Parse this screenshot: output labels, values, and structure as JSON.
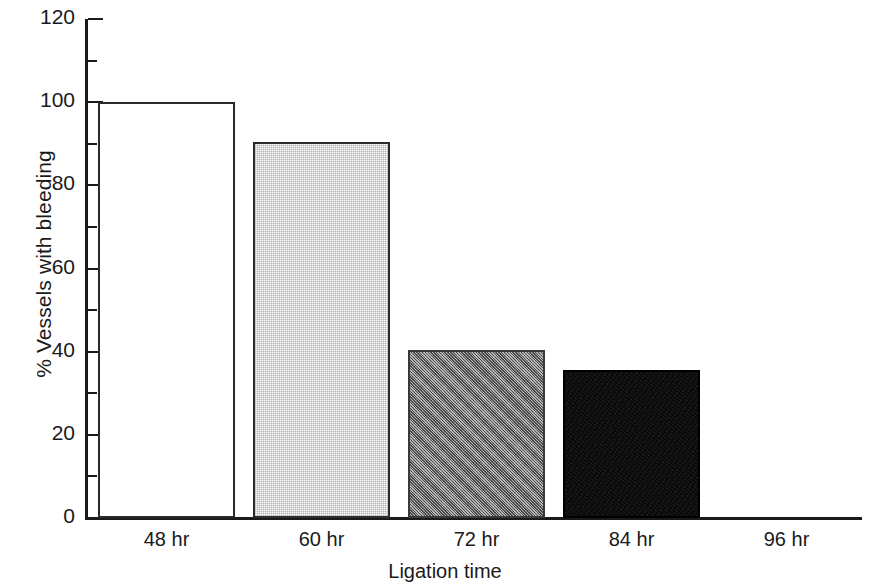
{
  "chart_data": {
    "type": "bar",
    "title": "",
    "xlabel": "Ligation time",
    "ylabel": "% Vessels with bleeding",
    "categories": [
      "48 hr",
      "60 hr",
      "72 hr",
      "84 hr",
      "96 hr"
    ],
    "values": [
      100,
      90.5,
      40.5,
      35.5,
      0
    ],
    "ylim": [
      0,
      120
    ],
    "y_major_ticks": [
      0,
      20,
      40,
      60,
      80,
      100,
      120
    ],
    "y_minor_ticks": [
      10,
      30,
      50,
      70,
      90,
      110
    ],
    "y_tick_labels": [
      "0",
      "20",
      "40",
      "60",
      "80",
      "100",
      "120"
    ],
    "grid": false,
    "legend": false,
    "bar_styles": [
      {
        "name": "white-open",
        "fill": "#ffffff",
        "edge": "#2b2b2b"
      },
      {
        "name": "light-gray-dither",
        "fill": "#f0f0f0",
        "edge": "#2b2b2b"
      },
      {
        "name": "mid-gray-dither",
        "fill": "#808080",
        "edge": "#3a3a3a"
      },
      {
        "name": "black",
        "fill": "#0a0a0a",
        "edge": "#000000"
      },
      {
        "name": "none",
        "fill": "none",
        "edge": "none"
      }
    ],
    "series": [
      {
        "name": "% Vessels with bleeding",
        "points": [
          {
            "category": "48 hr",
            "value": 100
          },
          {
            "category": "60 hr",
            "value": 90.5
          },
          {
            "category": "72 hr",
            "value": 40.5
          },
          {
            "category": "84 hr",
            "value": 35.5
          },
          {
            "category": "96 hr",
            "value": 0
          }
        ]
      }
    ]
  }
}
